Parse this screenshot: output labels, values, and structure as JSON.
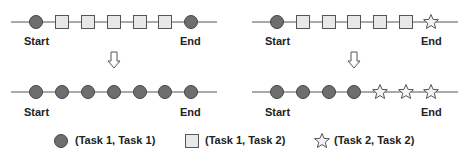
{
  "diagram": {
    "panels": [
      {
        "id": "left",
        "top_sequence": [
          "circle",
          "square",
          "square",
          "square",
          "square",
          "square",
          "circle"
        ],
        "bottom_sequence": [
          "circle",
          "circle",
          "circle",
          "circle",
          "circle",
          "circle",
          "circle"
        ],
        "start_label": "Start",
        "end_label": "End"
      },
      {
        "id": "right",
        "top_sequence": [
          "circle",
          "square",
          "square",
          "square",
          "square",
          "square",
          "star"
        ],
        "bottom_sequence": [
          "circle",
          "circle",
          "circle",
          "circle",
          "star",
          "star",
          "star"
        ],
        "start_label": "Start",
        "end_label": "End"
      }
    ],
    "arrow": "down-arrow"
  },
  "legend": [
    {
      "shape": "circle",
      "label": "(Task 1, Task 1)"
    },
    {
      "shape": "square",
      "label": "(Task 1, Task 2)"
    },
    {
      "shape": "star",
      "label": "(Task 2, Task 2)"
    }
  ],
  "labels": {
    "left_top_start": "Start",
    "left_top_end": "End",
    "right_top_start": "Start",
    "right_top_end": "End",
    "left_bottom_start": "Start",
    "left_bottom_end": "End",
    "right_bottom_start": "Start",
    "right_bottom_end": "End"
  },
  "colors": {
    "circle_fill": "#6e6e6e",
    "circle_stroke": "#444444",
    "square_fill": "#e8e8e8",
    "square_stroke": "#555555",
    "star_fill": "#f4f4f4",
    "star_stroke": "#555555",
    "line": "#555555"
  }
}
